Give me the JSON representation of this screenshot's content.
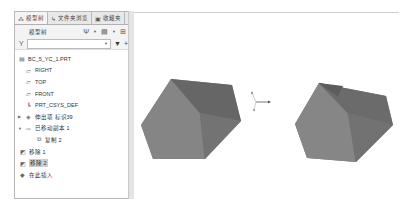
{
  "panel": {
    "tabs": [
      {
        "label": "模型树",
        "icon": "model-tree-icon"
      },
      {
        "label": "文件夹浏览",
        "icon": "folder-browser-icon"
      },
      {
        "label": "收藏夹",
        "icon": "favorites-icon"
      }
    ],
    "toolbar": {
      "title": "模型树"
    },
    "filter": {
      "value": "",
      "placeholder": ""
    }
  },
  "tree": {
    "root": "BC_5_YC_1.PRT",
    "items": [
      {
        "label": "RIGHT",
        "icon": "datum-plane-icon"
      },
      {
        "label": "TOP",
        "icon": "datum-plane-icon"
      },
      {
        "label": "FRONT",
        "icon": "datum-plane-icon"
      },
      {
        "label": "PRT_CSYS_DEF",
        "icon": "csys-icon"
      },
      {
        "label": "伸出项 标识39",
        "icon": "extrude-icon"
      },
      {
        "label": "已移动副本 1",
        "icon": "moved-copy-icon"
      },
      {
        "label": "复制 2",
        "icon": "copy-icon"
      },
      {
        "label": "移除 1",
        "icon": "remove-icon"
      },
      {
        "label": "移除 2",
        "icon": "remove-icon",
        "selected": true
      },
      {
        "label": "在此插入",
        "icon": "insert-here-icon"
      }
    ]
  },
  "colors": {
    "solid_dark": "#6a6a6a",
    "solid_mid": "#7c7c7c",
    "solid_light": "#8a8a8a",
    "selection": "#cfcfcf"
  }
}
